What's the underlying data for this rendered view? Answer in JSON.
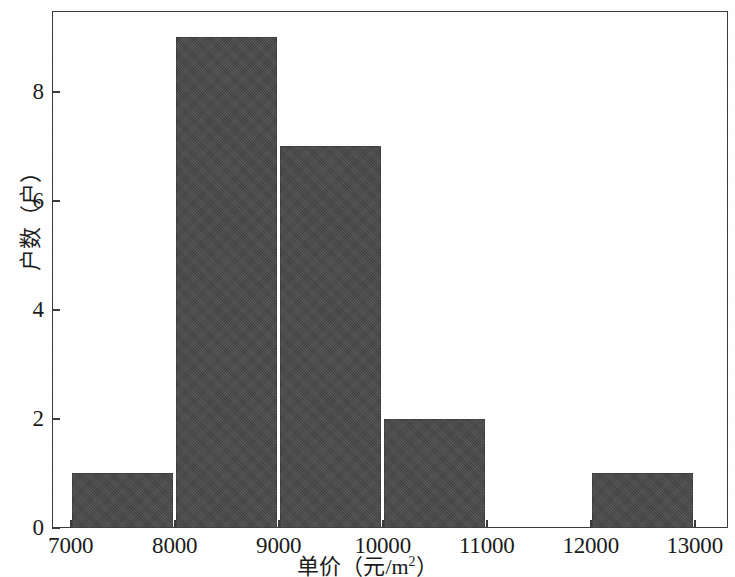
{
  "chart_data": {
    "type": "bar",
    "title": "",
    "subtitle": "",
    "xlabel": "单价（元/m²）",
    "ylabel": "户数（户）",
    "xlabel_parts": {
      "prefix": "单价（元/m",
      "superscript": "2",
      "suffix": "）"
    },
    "categories": [
      "7000-8000",
      "8000-9000",
      "9000-10000",
      "10000-11000",
      "11000-12000",
      "12000-13000"
    ],
    "bin_edges": [
      7000,
      8000,
      9000,
      10000,
      11000,
      12000,
      13000
    ],
    "values": [
      1,
      9,
      7,
      2,
      0,
      1
    ],
    "bin_width": 1000,
    "xlim": [
      6820,
      13320
    ],
    "ylim": [
      0,
      9.48
    ],
    "xticks": [
      7000,
      8000,
      9000,
      10000,
      11000,
      12000,
      13000
    ],
    "xticklabels": [
      "7000",
      "8000",
      "9000",
      "10000",
      "11000",
      "12000",
      "13000"
    ],
    "yticks": [
      0,
      2,
      4,
      6,
      8
    ],
    "yticklabels": [
      "0",
      "2",
      "4",
      "6",
      "8"
    ],
    "grid": false,
    "legend": null,
    "bar_color": "#474747",
    "axis_color": "#3b3b3b",
    "background_color": "#ffffff"
  }
}
